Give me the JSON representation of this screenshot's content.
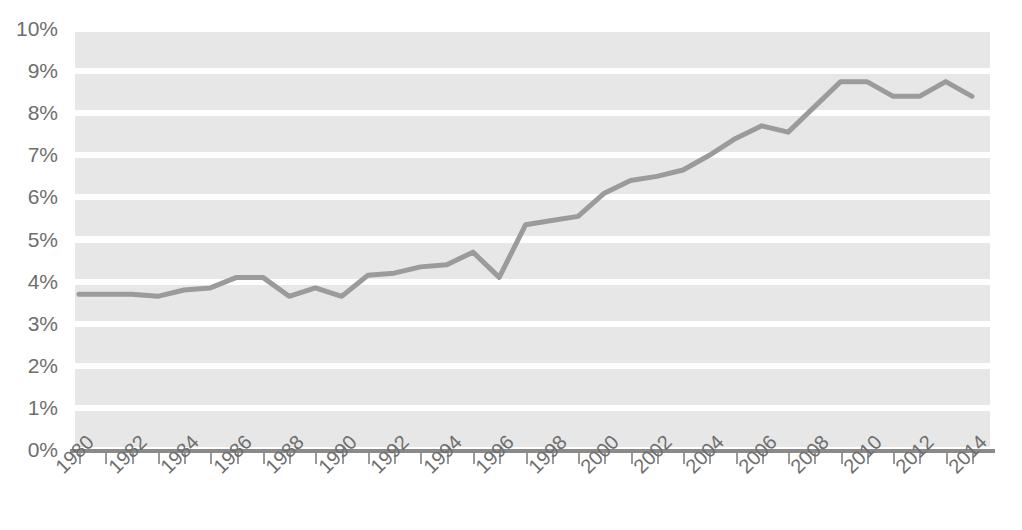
{
  "chart_data": {
    "type": "line",
    "title": "",
    "subtitle": "",
    "xlabel": "",
    "ylabel": "",
    "xlim": [
      1980,
      2014
    ],
    "ylim": [
      0,
      10
    ],
    "grid": true,
    "legend": false,
    "legend_position": "none",
    "y_tick_labels": [
      "10%",
      "9%",
      "8%",
      "7%",
      "6%",
      "5%",
      "4%",
      "3%",
      "2%",
      "1%",
      "0%"
    ],
    "y_tick_values": [
      10,
      9,
      8,
      7,
      6,
      5,
      4,
      3,
      2,
      1,
      0
    ],
    "x_tick_labels": [
      "1980",
      "1982",
      "1984",
      "1986",
      "1988",
      "1990",
      "1992",
      "1994",
      "1996",
      "1998",
      "2000",
      "2002",
      "2004",
      "2006",
      "2008",
      "2010",
      "2012",
      "2014"
    ],
    "x_tick_values": [
      1980,
      1982,
      1984,
      1986,
      1988,
      1990,
      1992,
      1994,
      1996,
      1998,
      2000,
      2002,
      2004,
      2006,
      2008,
      2010,
      2012,
      2014
    ],
    "x": [
      1980,
      1981,
      1982,
      1983,
      1984,
      1985,
      1986,
      1987,
      1988,
      1989,
      1990,
      1991,
      1992,
      1993,
      1994,
      1995,
      1996,
      1997,
      1998,
      1999,
      2000,
      2001,
      2002,
      2003,
      2004,
      2005,
      2006,
      2007,
      2008,
      2009,
      2010,
      2011,
      2012,
      2013,
      2014
    ],
    "values": [
      3.7,
      3.7,
      3.7,
      3.65,
      3.8,
      3.85,
      4.1,
      4.1,
      3.65,
      3.85,
      3.65,
      4.15,
      4.2,
      4.35,
      4.4,
      4.7,
      4.1,
      5.35,
      5.45,
      5.55,
      6.1,
      6.4,
      6.5,
      6.65,
      7.0,
      7.4,
      7.7,
      7.55,
      8.15,
      8.75,
      8.75,
      8.4,
      8.4,
      8.75,
      8.4
    ],
    "series": [
      {
        "name": "series-1",
        "color": "#9b9b9b",
        "values": [
          3.7,
          3.7,
          3.7,
          3.65,
          3.8,
          3.85,
          4.1,
          4.1,
          3.65,
          3.85,
          3.65,
          4.15,
          4.2,
          4.35,
          4.4,
          4.7,
          4.1,
          5.35,
          5.45,
          5.55,
          6.1,
          6.4,
          6.5,
          6.65,
          7.0,
          7.4,
          7.7,
          7.55,
          8.15,
          8.75,
          8.75,
          8.4,
          8.4,
          8.75,
          8.4
        ]
      }
    ],
    "colors": {
      "line": "#9b9b9b",
      "band": "#e7e7e7",
      "gridline": "#ffffff",
      "axis": "#8a8a8a",
      "tick_label": "#6e6e6e",
      "background": "#ffffff"
    }
  }
}
